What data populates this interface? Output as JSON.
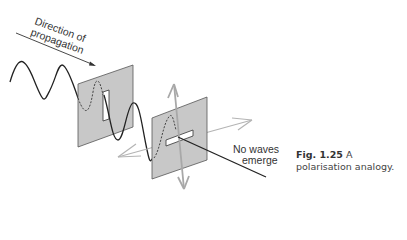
{
  "figure": {
    "labels": {
      "direction_line1": "Direction of",
      "direction_line2": "propagation",
      "no_waves_line1": "No waves",
      "no_waves_line2": "emerge"
    },
    "caption": {
      "number": "Fig. 1.25",
      "text": "A polarisation analogy."
    },
    "colors": {
      "panel_fill": "#c8c8c8",
      "panel_stroke": "#555555",
      "wave": "#222222",
      "arrows": "#b0b0b0"
    }
  }
}
